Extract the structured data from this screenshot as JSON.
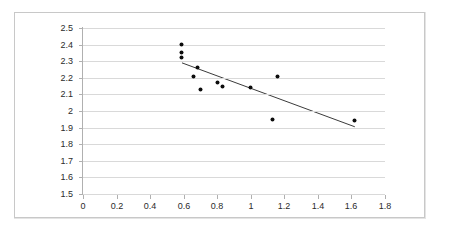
{
  "chart_data": {
    "type": "scatter",
    "title": "",
    "subtitle": "",
    "xlabel": "",
    "ylabel": "",
    "xlim": [
      0,
      1.8
    ],
    "ylim": [
      1.5,
      2.5
    ],
    "xticks": [
      "0",
      "0.2",
      "0.4",
      "0.6",
      "0.8",
      "1",
      "1.2",
      "1.4",
      "1.6",
      "1.8"
    ],
    "xtick_values": [
      0,
      0.2,
      0.4,
      0.6,
      0.8,
      1.0,
      1.2,
      1.4,
      1.6,
      1.8
    ],
    "yticks": [
      "2.5",
      "2.4",
      "2.3",
      "2.2",
      "2.1",
      "2",
      "1.9",
      "1.8",
      "1.7",
      "1.6",
      "1.5"
    ],
    "ytick_values": [
      2.5,
      2.4,
      2.3,
      2.2,
      2.1,
      2.0,
      1.9,
      1.8,
      1.7,
      1.6,
      1.5
    ],
    "grid": "horizontal",
    "legend": "none",
    "legend_position": "none",
    "marker_color": "#0d0d0d",
    "marker_shape": "circle",
    "gridline_color": "#d9d9d9",
    "axis_color": "#b0b0b0",
    "border_color": "#c8c8c8",
    "background_color": "#ffffff",
    "points": [
      {
        "x": 0.59,
        "y": 2.4
      },
      {
        "x": 0.59,
        "y": 2.35
      },
      {
        "x": 0.59,
        "y": 2.32
      },
      {
        "x": 0.68,
        "y": 2.265
      },
      {
        "x": 0.66,
        "y": 2.21
      },
      {
        "x": 0.7,
        "y": 2.13
      },
      {
        "x": 0.8,
        "y": 2.17
      },
      {
        "x": 0.83,
        "y": 2.15
      },
      {
        "x": 1.0,
        "y": 2.14
      },
      {
        "x": 1.16,
        "y": 2.21
      },
      {
        "x": 1.13,
        "y": 1.95
      },
      {
        "x": 1.62,
        "y": 1.94
      }
    ],
    "series": [
      {
        "name": "data",
        "x": [
          0.59,
          0.59,
          0.59,
          0.68,
          0.66,
          0.7,
          0.8,
          0.83,
          1.0,
          1.16,
          1.13,
          1.62
        ],
        "values": [
          2.4,
          2.35,
          2.32,
          2.265,
          2.21,
          2.13,
          2.17,
          2.15,
          2.14,
          2.21,
          1.95,
          1.94
        ]
      }
    ],
    "trendline": {
      "type": "linear",
      "color": "#3b3b3b",
      "x_start": 0.59,
      "y_start": 2.29,
      "x_end": 1.62,
      "y_end": 1.905
    }
  }
}
